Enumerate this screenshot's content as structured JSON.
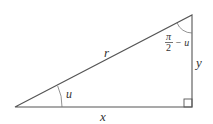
{
  "diagram": {
    "type": "right-triangle",
    "labels": {
      "hypotenuse": "r",
      "adjacent": "x",
      "opposite": "y",
      "angle_bottom_left": "u",
      "angle_top_pi": "π",
      "angle_top_den": "2",
      "angle_top_rest": "− u"
    },
    "colors": {
      "line": "#555555",
      "text": "#333333",
      "background": "#ffffff"
    }
  }
}
